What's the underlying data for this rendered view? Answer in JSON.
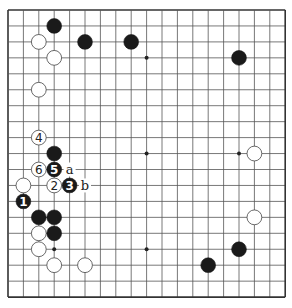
{
  "board": {
    "size": 19,
    "origin_x": 8,
    "origin_y": 10,
    "spacing_x": 15.4,
    "spacing_y": 15.95,
    "line_color": "#555555",
    "edge_color": "#333333",
    "star_points": [
      [
        3,
        3
      ],
      [
        9,
        3
      ],
      [
        15,
        3
      ],
      [
        3,
        9
      ],
      [
        9,
        9
      ],
      [
        15,
        9
      ],
      [
        3,
        15
      ],
      [
        9,
        15
      ],
      [
        15,
        15
      ]
    ]
  },
  "stones": [
    {
      "color": "black",
      "col": 3,
      "row": 1
    },
    {
      "color": "white",
      "col": 2,
      "row": 2
    },
    {
      "color": "black",
      "col": 5,
      "row": 2
    },
    {
      "color": "black",
      "col": 8,
      "row": 2
    },
    {
      "color": "white",
      "col": 3,
      "row": 3
    },
    {
      "color": "black",
      "col": 15,
      "row": 3
    },
    {
      "color": "white",
      "col": 2,
      "row": 5
    },
    {
      "color": "white",
      "col": 2,
      "row": 8,
      "label": "4"
    },
    {
      "color": "black",
      "col": 3,
      "row": 9
    },
    {
      "color": "white",
      "col": 16,
      "row": 9
    },
    {
      "color": "white",
      "col": 2,
      "row": 10,
      "label": "6"
    },
    {
      "color": "black",
      "col": 3,
      "row": 10,
      "label": "5"
    },
    {
      "color": "white",
      "col": 1,
      "row": 11
    },
    {
      "color": "white",
      "col": 3,
      "row": 11,
      "label": "2"
    },
    {
      "color": "black",
      "col": 4,
      "row": 11,
      "label": "3"
    },
    {
      "color": "black",
      "col": 1,
      "row": 12,
      "label": "1"
    },
    {
      "color": "black",
      "col": 2,
      "row": 13
    },
    {
      "color": "black",
      "col": 3,
      "row": 13
    },
    {
      "color": "white",
      "col": 16,
      "row": 13
    },
    {
      "color": "white",
      "col": 2,
      "row": 14
    },
    {
      "color": "black",
      "col": 3,
      "row": 14
    },
    {
      "color": "white",
      "col": 2,
      "row": 15
    },
    {
      "color": "black",
      "col": 15,
      "row": 15
    },
    {
      "color": "white",
      "col": 3,
      "row": 16
    },
    {
      "color": "white",
      "col": 5,
      "row": 16
    },
    {
      "color": "black",
      "col": 13,
      "row": 16
    }
  ],
  "markers": [
    {
      "label": "a",
      "col": 4,
      "row": 10
    },
    {
      "label": "b",
      "col": 5,
      "row": 11
    }
  ]
}
